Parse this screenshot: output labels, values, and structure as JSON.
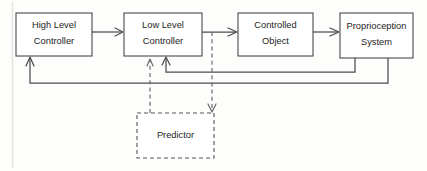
{
  "diagram": {
    "background_color": "#fdfdfc",
    "line_color": "#4d4d4d",
    "dashed_line_color": "#6a6a6a",
    "text_color": "#1d1d1d",
    "nodes": [
      {
        "id": "high-level-controller",
        "label_line1": "High Level",
        "label_line2": "Controller",
        "style": "solid",
        "x": 16,
        "y": 13,
        "w": 76,
        "h": 43
      },
      {
        "id": "low-level-controller",
        "label_line1": "Low Level",
        "label_line2": "Controller",
        "style": "solid",
        "x": 124,
        "y": 13,
        "w": 78,
        "h": 43
      },
      {
        "id": "controlled-object",
        "label_line1": "Controlled",
        "label_line2": "Object",
        "style": "solid",
        "x": 238,
        "y": 13,
        "w": 75,
        "h": 43
      },
      {
        "id": "proprioception-system",
        "label_line1": "Proprioception",
        "label_line2": "System",
        "style": "solid",
        "x": 340,
        "y": 13,
        "w": 73,
        "h": 45
      },
      {
        "id": "predictor",
        "label_line1": "Predictor",
        "label_line2": "",
        "style": "dashed",
        "x": 137,
        "y": 113,
        "w": 77,
        "h": 45
      }
    ],
    "edges": [
      {
        "id": "hlc-to-llc",
        "from": "high-level-controller",
        "to": "low-level-controller",
        "style": "solid",
        "direction": "right"
      },
      {
        "id": "llc-to-object",
        "from": "low-level-controller",
        "to": "controlled-object",
        "style": "solid",
        "direction": "right"
      },
      {
        "id": "object-to-proprioception",
        "from": "controlled-object",
        "to": "proprioception-system",
        "style": "solid",
        "direction": "right"
      },
      {
        "id": "proprioception-to-llc-feedback",
        "from": "proprioception-system",
        "to": "low-level-controller",
        "style": "solid",
        "direction": "up"
      },
      {
        "id": "proprioception-to-hlc-feedback",
        "from": "proprioception-system",
        "to": "high-level-controller",
        "style": "solid",
        "direction": "up"
      },
      {
        "id": "llc-to-predictor",
        "from": "low-level-controller",
        "to": "predictor",
        "style": "dashed",
        "direction": "down"
      },
      {
        "id": "predictor-to-llc",
        "from": "predictor",
        "to": "low-level-controller",
        "style": "dashed",
        "direction": "up"
      }
    ]
  }
}
